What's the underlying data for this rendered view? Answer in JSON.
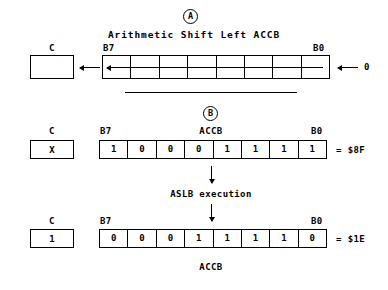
{
  "diagram": {
    "title": "Arithmetic Shift Left ACCB",
    "step_a_marker": "A",
    "step_b_marker": "B",
    "operation_label": "ASLB execution",
    "accumulator_name": "ACCB",
    "carry_label": "C",
    "msb_label": "B7",
    "lsb_label": "B0",
    "shift_in_value": "0"
  },
  "panel_a": {
    "carry_value": "",
    "register_bits": [
      "",
      "",
      "",
      "",
      "",
      "",
      "",
      ""
    ],
    "shift_in": "0"
  },
  "panel_b_before": {
    "carry_label": "C",
    "carry_value": "X",
    "msb_label": "B7",
    "lsb_label": "B0",
    "name": "ACCB",
    "register_bits": [
      "1",
      "0",
      "0",
      "0",
      "1",
      "1",
      "1",
      "1"
    ],
    "hex_equals": "= $8F"
  },
  "panel_b_after": {
    "carry_label": "C",
    "carry_value": "1",
    "msb_label": "B7",
    "lsb_label": "B0",
    "name": "ACCB",
    "register_bits": [
      "0",
      "0",
      "0",
      "1",
      "1",
      "1",
      "1",
      "0"
    ],
    "hex_equals": "= $1E"
  },
  "colors": {
    "ink": "#000000",
    "paper": "#ffffff"
  }
}
